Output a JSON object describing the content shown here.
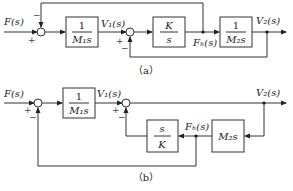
{
  "diagram_a": {
    "caption": "（a）",
    "input_label": "F(s)",
    "v1_label": "V₁(s)",
    "fb_label": "Fₕ(s)",
    "v2_label": "V₂(s)",
    "block1": {
      "num": "1",
      "den": "M₁s"
    },
    "block2": {
      "num": "K",
      "den": "s"
    },
    "block3": {
      "num": "1",
      "den": "M₂s"
    },
    "sum1_signs": {
      "left": "+",
      "top": "−"
    },
    "sum2_signs": {
      "left": "+",
      "bottom": "−"
    }
  },
  "diagram_b": {
    "caption": "（b）",
    "input_label": "F(s)",
    "v1_label": "V₁(s)",
    "fb_label": "Fₕ(s)",
    "v2_label": "V₂(s)",
    "block1": {
      "num": "1",
      "den": "M₁s"
    },
    "block2": {
      "num": "s",
      "den": "K"
    },
    "block3": {
      "label": "M₂s"
    },
    "sum1_signs": {
      "left": "+",
      "bottom": "−"
    },
    "sum2_signs": {
      "left": "+",
      "bottom": "−"
    }
  }
}
